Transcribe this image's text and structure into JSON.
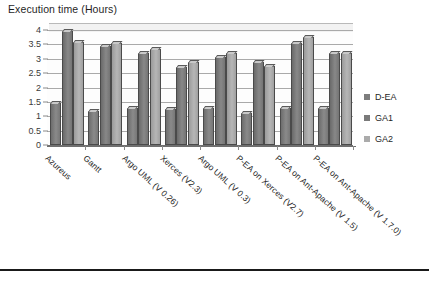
{
  "chart_data": {
    "type": "bar",
    "title": "Execution time (Hours)",
    "xlabel": "",
    "ylabel": "",
    "ylim": [
      0,
      4
    ],
    "yticks": [
      0,
      0.5,
      1,
      1.5,
      2,
      2.5,
      3,
      3.5,
      4
    ],
    "ytick_labels": [
      "0",
      "0.5",
      "1",
      "1.5",
      "2",
      "2.5",
      "3",
      "3.5",
      "4"
    ],
    "grid": true,
    "legend_position": "right",
    "categories": [
      "Azureus",
      "Gantt",
      "Argo UML (V 0.26)",
      "Xerces (V2.3)",
      "Argo UML (V 0.3)",
      "P-EA on Xerces (V2.7)",
      "P-EA on Ant-Apache (V 1.5)",
      "P-EA on Ant-Apache (V 1.7.0)"
    ],
    "series": [
      {
        "name": "D-EA",
        "color": "#7d7d7d",
        "values": [
          1.45,
          1.2,
          1.3,
          1.25,
          1.3,
          1.1,
          1.3,
          1.3
        ]
      },
      {
        "name": "GA1",
        "color": "#7a7a7a",
        "values": [
          3.95,
          3.45,
          3.2,
          2.7,
          3.05,
          2.9,
          3.55,
          3.2
        ]
      },
      {
        "name": "GA2",
        "color": "#ababab",
        "values": [
          3.6,
          3.55,
          3.35,
          2.9,
          3.2,
          2.75,
          3.75,
          3.2
        ]
      }
    ]
  },
  "legend": {
    "items": [
      {
        "label": "D-EA"
      },
      {
        "label": "GA1"
      },
      {
        "label": "GA2"
      }
    ]
  },
  "caption": ""
}
